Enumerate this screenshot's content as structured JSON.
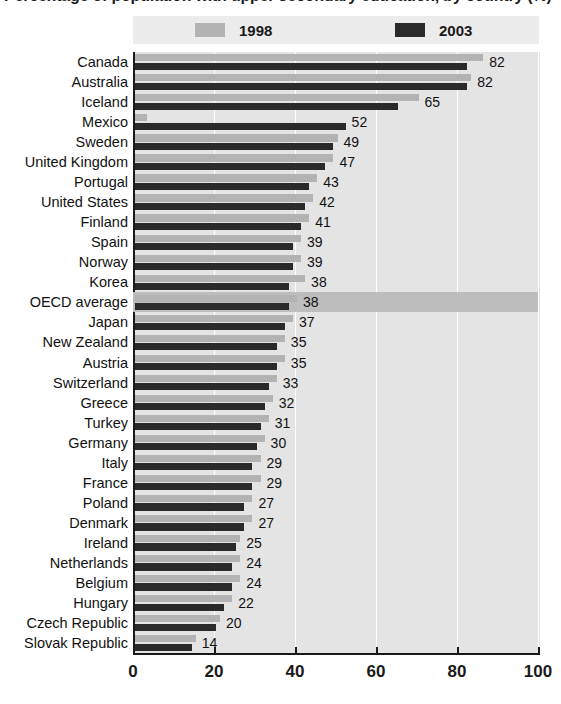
{
  "title": {
    "text": "Percentage of population with upper secondary education, by country (%)",
    "clipped": true
  },
  "legend": {
    "position": "top",
    "items": [
      {
        "label": "1998",
        "color": "#b3b3b3",
        "swatch_name": "legend-swatch-1998"
      },
      {
        "label": "2003",
        "color": "#2a2a2a",
        "swatch_name": "legend-swatch-2003"
      }
    ]
  },
  "axis": {
    "ticks": [
      "0",
      "20",
      "40",
      "60",
      "80",
      "100"
    ],
    "min": 0,
    "max": 100
  },
  "highlight_row": "OECD average",
  "highlight_color": "#bdbdbd",
  "chart_data": {
    "type": "bar",
    "orientation": "horizontal",
    "title": "Percentage of population with upper secondary education, by country (%)",
    "xlabel": "",
    "ylabel": "",
    "xlim": [
      0,
      100
    ],
    "grid": true,
    "legend_position": "top",
    "categories": [
      "Canada",
      "Australia",
      "Iceland",
      "Mexico",
      "Sweden",
      "United Kingdom",
      "Portugal",
      "United States",
      "Finland",
      "Spain",
      "Norway",
      "Korea",
      "OECD average",
      "Japan",
      "New Zealand",
      "Austria",
      "Switzerland",
      "Greece",
      "Turkey",
      "Germany",
      "Italy",
      "France",
      "Poland",
      "Denmark",
      "Ireland",
      "Netherlands",
      "Belgium",
      "Hungary",
      "Czech Republic",
      "Slovak Republic"
    ],
    "series": [
      {
        "name": "1998",
        "color": "#b3b3b3",
        "values": [
          86,
          83,
          70,
          3,
          50,
          49,
          45,
          44,
          43,
          41,
          41,
          42,
          40,
          39,
          37,
          37,
          35,
          34,
          33,
          32,
          31,
          31,
          29,
          29,
          26,
          26,
          26,
          24,
          21,
          15
        ]
      },
      {
        "name": "2003",
        "color": "#2a2a2a",
        "values": [
          82,
          82,
          65,
          52,
          49,
          47,
          43,
          42,
          41,
          39,
          39,
          38,
          38,
          37,
          35,
          35,
          33,
          32,
          31,
          30,
          29,
          29,
          27,
          27,
          25,
          24,
          24,
          22,
          20,
          14
        ]
      }
    ],
    "data_labels": [
      "82",
      "82",
      "65",
      "52",
      "49",
      "47",
      "43",
      "42",
      "41",
      "39",
      "39",
      "38",
      "38",
      "37",
      "35",
      "35",
      "33",
      "32",
      "31",
      "30",
      "29",
      "29",
      "27",
      "27",
      "25",
      "24",
      "24",
      "22",
      "20",
      "14"
    ]
  }
}
